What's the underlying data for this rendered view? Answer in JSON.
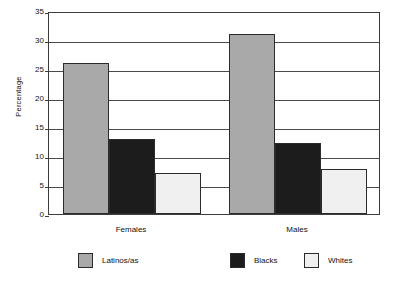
{
  "chart_data": {
    "type": "bar",
    "title": "",
    "xlabel": "",
    "ylabel": "Percentage",
    "ylim": [
      0,
      35
    ],
    "yticks": [
      0,
      5,
      10,
      15,
      20,
      25,
      30,
      35
    ],
    "ytick_labels": [
      "0",
      "5",
      "10",
      "15",
      "20",
      "25",
      "30",
      "35"
    ],
    "grid": true,
    "legend_position": "bottom",
    "categories": [
      "Females",
      "Males"
    ],
    "series": [
      {
        "name": "Latinos/as",
        "values": [
          26.1,
          31.1
        ],
        "color": "#a9a9a9"
      },
      {
        "name": "Blacks",
        "values": [
          13.0,
          12.2
        ],
        "color": "#1c1c1c"
      },
      {
        "name": "Whites",
        "values": [
          7.0,
          7.8
        ],
        "color": "#f0f0f0"
      }
    ]
  },
  "legend": {
    "items": [
      {
        "label": "Latinos/as",
        "color": "#a9a9a9"
      },
      {
        "label": "Blacks",
        "color": "#1c1c1c"
      },
      {
        "label": "Whites",
        "color": "#f0f0f0"
      }
    ]
  }
}
